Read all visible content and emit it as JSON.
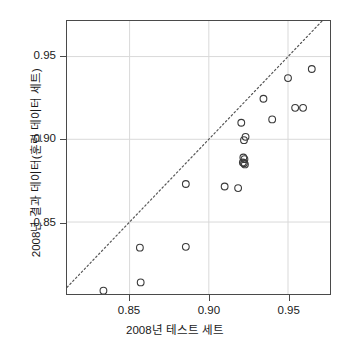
{
  "chart_data": {
    "type": "scatter",
    "title": "",
    "xlabel": "2008년 테스트 세트",
    "ylabel": "2008년 결과 데이터(훈련 데이터 세트)",
    "xlim": [
      0.8105,
      0.9765
    ],
    "ylim": [
      0.8065,
      0.9715
    ],
    "xticks": [
      0.85,
      0.9,
      0.95
    ],
    "yticks": [
      0.85,
      0.9,
      0.95
    ],
    "xtick_labels": [
      "0.85",
      "0.90",
      "0.95"
    ],
    "ytick_labels": [
      "0.85",
      "0.90",
      "0.95"
    ],
    "grid": true,
    "legend": null,
    "marker": "open-circle",
    "marker_color": "#3a3a3a",
    "reference_line": {
      "type": "identity",
      "style": "dotted",
      "color": "#555555",
      "x": [
        0.8105,
        0.9765
      ],
      "y": [
        0.8105,
        0.9765
      ]
    },
    "series": [
      {
        "name": "models",
        "points": [
          {
            "x": 0.8335,
            "y": 0.8085
          },
          {
            "x": 0.8565,
            "y": 0.8345
          },
          {
            "x": 0.857,
            "y": 0.8135
          },
          {
            "x": 0.8855,
            "y": 0.835
          },
          {
            "x": 0.8855,
            "y": 0.873
          },
          {
            "x": 0.91,
            "y": 0.8715
          },
          {
            "x": 0.9185,
            "y": 0.8705
          },
          {
            "x": 0.9215,
            "y": 0.886
          },
          {
            "x": 0.9222,
            "y": 0.8855
          },
          {
            "x": 0.9228,
            "y": 0.8848
          },
          {
            "x": 0.9225,
            "y": 0.888
          },
          {
            "x": 0.9218,
            "y": 0.889
          },
          {
            "x": 0.9222,
            "y": 0.8995
          },
          {
            "x": 0.9232,
            "y": 0.9015
          },
          {
            "x": 0.9205,
            "y": 0.91
          },
          {
            "x": 0.9345,
            "y": 0.9245
          },
          {
            "x": 0.94,
            "y": 0.912
          },
          {
            "x": 0.95,
            "y": 0.937
          },
          {
            "x": 0.9545,
            "y": 0.919
          },
          {
            "x": 0.9595,
            "y": 0.919
          },
          {
            "x": 0.965,
            "y": 0.9425
          }
        ]
      }
    ]
  }
}
